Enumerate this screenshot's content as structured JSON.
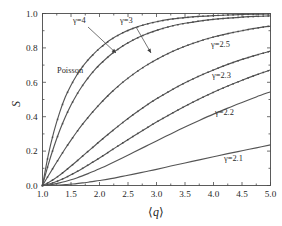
{
  "chart_data": {
    "type": "line",
    "title": "",
    "xlabel": "⟨q⟩",
    "ylabel": "S",
    "xlim": [
      1.0,
      5.0
    ],
    "ylim": [
      0.0,
      1.0
    ],
    "grid": false,
    "legend_position": "inline-annotations",
    "xticks": [
      "1.0",
      "1.5",
      "2.0",
      "2.5",
      "3.0",
      "3.5",
      "4.0",
      "4.5",
      "5.0"
    ],
    "xtick_values": [
      1.0,
      1.5,
      2.0,
      2.5,
      3.0,
      3.5,
      4.0,
      4.5,
      5.0
    ],
    "yticks": [
      "0.0",
      "0.2",
      "0.4",
      "0.6",
      "0.8",
      "1.0"
    ],
    "ytick_values": [
      0.0,
      0.2,
      0.4,
      0.6,
      0.8,
      1.0
    ],
    "x": [
      1.0,
      1.1,
      1.2,
      1.3,
      1.4,
      1.5,
      1.6,
      1.7,
      1.8,
      1.9,
      2.0,
      2.2,
      2.4,
      2.6,
      2.8,
      3.0,
      3.25,
      3.5,
      3.75,
      4.0,
      4.25,
      4.5,
      4.75,
      5.0
    ],
    "series": [
      {
        "name": "Poisson",
        "label": "Poisson",
        "color": "#555555",
        "markers": true,
        "values": [
          0.0,
          0.175,
          0.313,
          0.424,
          0.514,
          0.583,
          0.641,
          0.69,
          0.731,
          0.765,
          0.797,
          0.849,
          0.887,
          0.915,
          0.936,
          0.952,
          0.967,
          0.976,
          0.983,
          0.988,
          0.991,
          0.994,
          0.996,
          0.997
        ]
      },
      {
        "name": "gamma4",
        "label": "γ=4",
        "color": "#555555",
        "markers": true,
        "values": [
          0.0,
          0.12,
          0.225,
          0.318,
          0.398,
          0.468,
          0.528,
          0.58,
          0.626,
          0.666,
          0.702,
          0.762,
          0.81,
          0.848,
          0.878,
          0.902,
          0.926,
          0.943,
          0.956,
          0.966,
          0.973,
          0.979,
          0.983,
          0.986
        ]
      },
      {
        "name": "gamma3",
        "label": "γ=3",
        "color": "#555555",
        "markers": true,
        "values": [
          0.0,
          0.055,
          0.11,
          0.163,
          0.215,
          0.264,
          0.311,
          0.355,
          0.396,
          0.435,
          0.472,
          0.539,
          0.598,
          0.649,
          0.694,
          0.733,
          0.775,
          0.81,
          0.839,
          0.863,
          0.883,
          0.9,
          0.915,
          0.927
        ]
      },
      {
        "name": "gamma2.5",
        "label": "γ=2.5",
        "color": "#555555",
        "markers": true,
        "values": [
          0.0,
          0.016,
          0.036,
          0.06,
          0.086,
          0.113,
          0.141,
          0.17,
          0.199,
          0.227,
          0.256,
          0.311,
          0.364,
          0.414,
          0.461,
          0.504,
          0.553,
          0.597,
          0.637,
          0.672,
          0.704,
          0.733,
          0.758,
          0.781
        ]
      },
      {
        "name": "gamma2.3",
        "label": "γ=2.3",
        "color": "#555555",
        "markers": true,
        "values": [
          0.0,
          0.007,
          0.017,
          0.03,
          0.045,
          0.062,
          0.08,
          0.099,
          0.119,
          0.139,
          0.16,
          0.203,
          0.246,
          0.288,
          0.329,
          0.369,
          0.416,
          0.461,
          0.503,
          0.542,
          0.578,
          0.612,
          0.643,
          0.672
        ]
      },
      {
        "name": "gamma2.2",
        "label": "γ=2.2",
        "color": "#6a6a6a",
        "markers": false,
        "values": [
          0.0,
          0.003,
          0.008,
          0.015,
          0.023,
          0.033,
          0.044,
          0.056,
          0.069,
          0.083,
          0.097,
          0.128,
          0.16,
          0.193,
          0.226,
          0.259,
          0.3,
          0.34,
          0.378,
          0.415,
          0.45,
          0.483,
          0.515,
          0.545
        ]
      },
      {
        "name": "gamma2.1",
        "label": "γ=2.1",
        "color": "#6a6a6a",
        "markers": false,
        "values": [
          0.0,
          0.0005,
          0.0015,
          0.003,
          0.005,
          0.008,
          0.011,
          0.015,
          0.019,
          0.024,
          0.029,
          0.04,
          0.053,
          0.066,
          0.08,
          0.094,
          0.113,
          0.131,
          0.149,
          0.167,
          0.185,
          0.202,
          0.219,
          0.236
        ]
      }
    ],
    "annotations": [
      {
        "name": "poisson-label",
        "text": "Poisson",
        "x_px": 57,
        "y_px": 73,
        "arrow": false
      },
      {
        "name": "gamma4-callout",
        "text": "γ=4",
        "x_px": 73,
        "y_px": 23,
        "arrow": true,
        "arrow_from": [
          88,
          27
        ],
        "arrow_to": [
          116,
          53
        ]
      },
      {
        "name": "gamma3-callout",
        "text": "γ=3",
        "x_px": 120,
        "y_px": 23,
        "arrow": true,
        "arrow_from": [
          136,
          27
        ],
        "arrow_to": [
          151,
          53
        ]
      },
      {
        "name": "gamma25-label",
        "text": "γ=2.5",
        "x_px": 211,
        "y_px": 47,
        "arrow": false
      },
      {
        "name": "gamma23-label",
        "text": "γ=2.3",
        "x_px": 212,
        "y_px": 78,
        "arrow": false
      },
      {
        "name": "gamma22-label",
        "text": "γ=2.2",
        "x_px": 215,
        "y_px": 115,
        "arrow": false
      },
      {
        "name": "gamma21-label",
        "text": "γ=2.1",
        "x_px": 224,
        "y_px": 161,
        "arrow": false
      }
    ]
  },
  "axes": {
    "y_axis_label": "S",
    "x_axis_label_open": "⟨",
    "x_axis_label_var": "q",
    "x_axis_label_close": "⟩"
  },
  "colors": {
    "frame": "#4a4a4a",
    "curve": "#555555",
    "curve_light": "#6a6a6a",
    "text": "#1f1f1f",
    "background": "#ffffff"
  }
}
